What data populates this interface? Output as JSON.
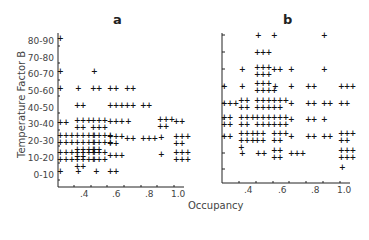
{
  "chart_data": [
    {
      "type": "scatter",
      "title": "a",
      "xlabel": "Occupancy",
      "ylabel": "Temperature Factor B",
      "x_ticks": [
        ".4",
        ".6",
        ".8",
        "1.0"
      ],
      "y_ticks": [
        "0-10",
        "10-20",
        "20-30",
        "30-40",
        "40-50",
        "50-60",
        "60-70",
        "70-80",
        "80-90"
      ],
      "xlim": [
        0.25,
        1.05
      ],
      "grid": false,
      "points_per_cell": [
        {
          "x": 0.25,
          "y": "80-90",
          "count": 1
        },
        {
          "x": 0.25,
          "y": "60-70",
          "count": 1
        },
        {
          "x": 0.25,
          "y": "50-60",
          "count": 1
        },
        {
          "x": 0.25,
          "y": "30-40",
          "count": 2
        },
        {
          "x": 0.25,
          "y": "20-30",
          "count": 6
        },
        {
          "x": 0.25,
          "y": "10-20",
          "count": 6
        },
        {
          "x": 0.25,
          "y": "0-10",
          "count": 1
        },
        {
          "x": 0.35,
          "y": "50-60",
          "count": 1
        },
        {
          "x": 0.35,
          "y": "40-50",
          "count": 2
        },
        {
          "x": 0.35,
          "y": "30-40",
          "count": 5
        },
        {
          "x": 0.35,
          "y": "20-30",
          "count": 14
        },
        {
          "x": 0.35,
          "y": "10-20",
          "count": 10
        },
        {
          "x": 0.35,
          "y": "0-10",
          "count": 1
        },
        {
          "x": 0.45,
          "y": "60-70",
          "count": 1
        },
        {
          "x": 0.45,
          "y": "50-60",
          "count": 2
        },
        {
          "x": 0.45,
          "y": "30-40",
          "count": 6
        },
        {
          "x": 0.45,
          "y": "20-30",
          "count": 10
        },
        {
          "x": 0.45,
          "y": "10-20",
          "count": 6
        },
        {
          "x": 0.45,
          "y": "0-10",
          "count": 1
        },
        {
          "x": 0.55,
          "y": "50-60",
          "count": 2
        },
        {
          "x": 0.55,
          "y": "40-50",
          "count": 3
        },
        {
          "x": 0.55,
          "y": "30-40",
          "count": 3
        },
        {
          "x": 0.55,
          "y": "20-30",
          "count": 5
        },
        {
          "x": 0.55,
          "y": "10-20",
          "count": 3
        },
        {
          "x": 0.55,
          "y": "0-10",
          "count": 2
        },
        {
          "x": 0.65,
          "y": "50-60",
          "count": 2
        },
        {
          "x": 0.65,
          "y": "40-50",
          "count": 2
        },
        {
          "x": 0.65,
          "y": "30-40",
          "count": 1
        },
        {
          "x": 0.65,
          "y": "20-30",
          "count": 2
        },
        {
          "x": 0.75,
          "y": "40-50",
          "count": 2
        },
        {
          "x": 0.75,
          "y": "20-30",
          "count": 3
        },
        {
          "x": 0.85,
          "y": "30-40",
          "count": 5
        },
        {
          "x": 0.85,
          "y": "20-30",
          "count": 1
        },
        {
          "x": 0.85,
          "y": "10-20",
          "count": 1
        },
        {
          "x": 0.95,
          "y": "30-40",
          "count": 2
        },
        {
          "x": 0.95,
          "y": "20-30",
          "count": 5
        },
        {
          "x": 0.95,
          "y": "10-20",
          "count": 6
        }
      ]
    },
    {
      "type": "scatter",
      "title": "b",
      "xlabel": "Occupancy",
      "ylabel": "Temperature Factor B",
      "x_ticks": [
        ".4",
        ".6",
        ".8",
        "1.0"
      ],
      "y_ticks": [
        "0-10",
        "10-20",
        "20-30",
        "30-40",
        "40-50",
        "50-60",
        "60-70",
        "70-80",
        "80-90"
      ],
      "xlim": [
        0.25,
        1.05
      ],
      "grid": false,
      "points_per_cell": [
        {
          "x": 0.45,
          "y": "80-90",
          "count": 1
        },
        {
          "x": 0.55,
          "y": "80-90",
          "count": 1
        },
        {
          "x": 0.85,
          "y": "80-90",
          "count": 1
        },
        {
          "x": 0.45,
          "y": "70-80",
          "count": 3
        },
        {
          "x": 0.35,
          "y": "60-70",
          "count": 1
        },
        {
          "x": 0.45,
          "y": "60-70",
          "count": 7
        },
        {
          "x": 0.55,
          "y": "60-70",
          "count": 2
        },
        {
          "x": 0.65,
          "y": "60-70",
          "count": 1
        },
        {
          "x": 0.85,
          "y": "60-70",
          "count": 1
        },
        {
          "x": 0.25,
          "y": "50-60",
          "count": 1
        },
        {
          "x": 0.35,
          "y": "50-60",
          "count": 1
        },
        {
          "x": 0.45,
          "y": "50-60",
          "count": 8
        },
        {
          "x": 0.55,
          "y": "50-60",
          "count": 1
        },
        {
          "x": 0.65,
          "y": "50-60",
          "count": 1
        },
        {
          "x": 0.75,
          "y": "50-60",
          "count": 2
        },
        {
          "x": 0.95,
          "y": "50-60",
          "count": 3
        },
        {
          "x": 0.25,
          "y": "40-50",
          "count": 3
        },
        {
          "x": 0.35,
          "y": "40-50",
          "count": 4
        },
        {
          "x": 0.45,
          "y": "40-50",
          "count": 6
        },
        {
          "x": 0.55,
          "y": "40-50",
          "count": 5
        },
        {
          "x": 0.65,
          "y": "40-50",
          "count": 1
        },
        {
          "x": 0.75,
          "y": "40-50",
          "count": 2
        },
        {
          "x": 0.85,
          "y": "40-50",
          "count": 2
        },
        {
          "x": 0.95,
          "y": "40-50",
          "count": 2
        },
        {
          "x": 0.25,
          "y": "30-40",
          "count": 4
        },
        {
          "x": 0.35,
          "y": "30-40",
          "count": 5
        },
        {
          "x": 0.45,
          "y": "30-40",
          "count": 6
        },
        {
          "x": 0.55,
          "y": "30-40",
          "count": 6
        },
        {
          "x": 0.65,
          "y": "30-40",
          "count": 1
        },
        {
          "x": 0.75,
          "y": "30-40",
          "count": 2
        },
        {
          "x": 0.85,
          "y": "30-40",
          "count": 1
        },
        {
          "x": 0.25,
          "y": "20-30",
          "count": 2
        },
        {
          "x": 0.35,
          "y": "20-30",
          "count": 7
        },
        {
          "x": 0.45,
          "y": "20-30",
          "count": 4
        },
        {
          "x": 0.55,
          "y": "20-30",
          "count": 5
        },
        {
          "x": 0.65,
          "y": "20-30",
          "count": 1
        },
        {
          "x": 0.75,
          "y": "20-30",
          "count": 2
        },
        {
          "x": 0.85,
          "y": "20-30",
          "count": 2
        },
        {
          "x": 0.95,
          "y": "20-30",
          "count": 5
        },
        {
          "x": 0.35,
          "y": "10-20",
          "count": 1
        },
        {
          "x": 0.45,
          "y": "10-20",
          "count": 2
        },
        {
          "x": 0.55,
          "y": "10-20",
          "count": 4
        },
        {
          "x": 0.65,
          "y": "10-20",
          "count": 3
        },
        {
          "x": 0.95,
          "y": "10-20",
          "count": 6
        },
        {
          "x": 0.95,
          "y": "0-10",
          "count": 1
        }
      ]
    }
  ],
  "panels": {
    "a": {
      "title": "a",
      "y_ticks": [
        "80-90",
        "70-80",
        "60-70",
        "50-60",
        "40-50",
        "30-40",
        "20-30",
        "10-20",
        "0-10"
      ],
      "x_ticks": [
        ".4",
        ".6",
        ".8",
        "1.0"
      ],
      "glyphs": [
        {
          "x": 58,
          "y": 38,
          "t": "+"
        },
        {
          "x": 58,
          "y": 71,
          "t": "+"
        },
        {
          "x": 58,
          "y": 88,
          "t": "+"
        },
        {
          "x": 58,
          "y": 122,
          "t": "++"
        },
        {
          "x": 58,
          "y": 135,
          "t": "+++\n+++"
        },
        {
          "x": 58,
          "y": 152,
          "t": "+++\n+++"
        },
        {
          "x": 58,
          "y": 171,
          "t": "+"
        },
        {
          "x": 76,
          "y": 88,
          "t": "+"
        },
        {
          "x": 75,
          "y": 105,
          "t": "++"
        },
        {
          "x": 75,
          "y": 120,
          "t": "+++\n++"
        },
        {
          "x": 75,
          "y": 135,
          "t": "++++\n++++\n++++\n++"
        },
        {
          "x": 75,
          "y": 152,
          "t": "++++\n++++\n++"
        },
        {
          "x": 76,
          "y": 171,
          "t": "+"
        },
        {
          "x": 92,
          "y": 71,
          "t": "+"
        },
        {
          "x": 91,
          "y": 88,
          "t": "++"
        },
        {
          "x": 91,
          "y": 120,
          "t": "+++\n+++"
        },
        {
          "x": 91,
          "y": 135,
          "t": "++++\n++++\n++"
        },
        {
          "x": 91,
          "y": 152,
          "t": "+++\n+++"
        },
        {
          "x": 94,
          "y": 171,
          "t": "+"
        },
        {
          "x": 108,
          "y": 88,
          "t": "++"
        },
        {
          "x": 108,
          "y": 105,
          "t": "+++"
        },
        {
          "x": 108,
          "y": 121,
          "t": "+++"
        },
        {
          "x": 108,
          "y": 136,
          "t": "+++\n++"
        },
        {
          "x": 108,
          "y": 155,
          "t": "+++"
        },
        {
          "x": 108,
          "y": 171,
          "t": "++"
        },
        {
          "x": 125,
          "y": 88,
          "t": "++"
        },
        {
          "x": 125,
          "y": 105,
          "t": "++"
        },
        {
          "x": 126,
          "y": 121,
          "t": "+"
        },
        {
          "x": 125,
          "y": 138,
          "t": "++"
        },
        {
          "x": 141,
          "y": 105,
          "t": "++"
        },
        {
          "x": 141,
          "y": 138,
          "t": "+++"
        },
        {
          "x": 158,
          "y": 119,
          "t": "+++\n++"
        },
        {
          "x": 159,
          "y": 137,
          "t": "+"
        },
        {
          "x": 159,
          "y": 154,
          "t": "+"
        },
        {
          "x": 174,
          "y": 121,
          "t": "++"
        },
        {
          "x": 174,
          "y": 136,
          "t": "+++\n++"
        },
        {
          "x": 174,
          "y": 152,
          "t": "+++\n+++"
        }
      ]
    },
    "b": {
      "title": "b",
      "x_ticks": [
        ".4",
        ".6",
        ".8",
        "1.0"
      ],
      "glyphs": [
        {
          "x": 256,
          "y": 35,
          "t": "+"
        },
        {
          "x": 272,
          "y": 35,
          "t": "+"
        },
        {
          "x": 322,
          "y": 35,
          "t": "+"
        },
        {
          "x": 255,
          "y": 52,
          "t": "+++"
        },
        {
          "x": 240,
          "y": 69,
          "t": "+"
        },
        {
          "x": 255,
          "y": 67,
          "t": "+++\n+++"
        },
        {
          "x": 272,
          "y": 69,
          "t": "++"
        },
        {
          "x": 289,
          "y": 69,
          "t": "+"
        },
        {
          "x": 322,
          "y": 69,
          "t": "+"
        },
        {
          "x": 222,
          "y": 86,
          "t": "+"
        },
        {
          "x": 240,
          "y": 86,
          "t": "+"
        },
        {
          "x": 255,
          "y": 83,
          "t": "+++\n++++"
        },
        {
          "x": 273,
          "y": 86,
          "t": "+"
        },
        {
          "x": 289,
          "y": 86,
          "t": "+"
        },
        {
          "x": 306,
          "y": 86,
          "t": "++"
        },
        {
          "x": 339,
          "y": 86,
          "t": "+++"
        },
        {
          "x": 222,
          "y": 103,
          "t": "+++"
        },
        {
          "x": 239,
          "y": 100,
          "t": "++\n++"
        },
        {
          "x": 255,
          "y": 100,
          "t": "+++\n+++"
        },
        {
          "x": 272,
          "y": 100,
          "t": "+++\n++"
        },
        {
          "x": 289,
          "y": 103,
          "t": "+"
        },
        {
          "x": 306,
          "y": 103,
          "t": "++"
        },
        {
          "x": 322,
          "y": 103,
          "t": "++"
        },
        {
          "x": 339,
          "y": 103,
          "t": "++"
        },
        {
          "x": 222,
          "y": 117,
          "t": "++\n++"
        },
        {
          "x": 239,
          "y": 117,
          "t": "+++\n++"
        },
        {
          "x": 255,
          "y": 117,
          "t": "+++\n+++"
        },
        {
          "x": 272,
          "y": 117,
          "t": "+++\n+++"
        },
        {
          "x": 289,
          "y": 119,
          "t": "+"
        },
        {
          "x": 306,
          "y": 119,
          "t": "++"
        },
        {
          "x": 322,
          "y": 119,
          "t": "+"
        },
        {
          "x": 222,
          "y": 136,
          "t": "++"
        },
        {
          "x": 239,
          "y": 133,
          "t": "+++\n+++\n+"
        },
        {
          "x": 255,
          "y": 133,
          "t": "++\n++"
        },
        {
          "x": 272,
          "y": 133,
          "t": "+++\n++"
        },
        {
          "x": 289,
          "y": 136,
          "t": "+"
        },
        {
          "x": 306,
          "y": 136,
          "t": "++"
        },
        {
          "x": 322,
          "y": 136,
          "t": "++"
        },
        {
          "x": 339,
          "y": 133,
          "t": "+++\n++"
        },
        {
          "x": 240,
          "y": 153,
          "t": "+"
        },
        {
          "x": 256,
          "y": 153,
          "t": "++"
        },
        {
          "x": 272,
          "y": 150,
          "t": "++\n++"
        },
        {
          "x": 289,
          "y": 153,
          "t": "+++"
        },
        {
          "x": 339,
          "y": 150,
          "t": "+++\n+++"
        },
        {
          "x": 340,
          "y": 167,
          "t": "+"
        }
      ]
    }
  },
  "axis": {
    "y_title": "Temperature Factor B",
    "x_title": "Occupancy"
  }
}
